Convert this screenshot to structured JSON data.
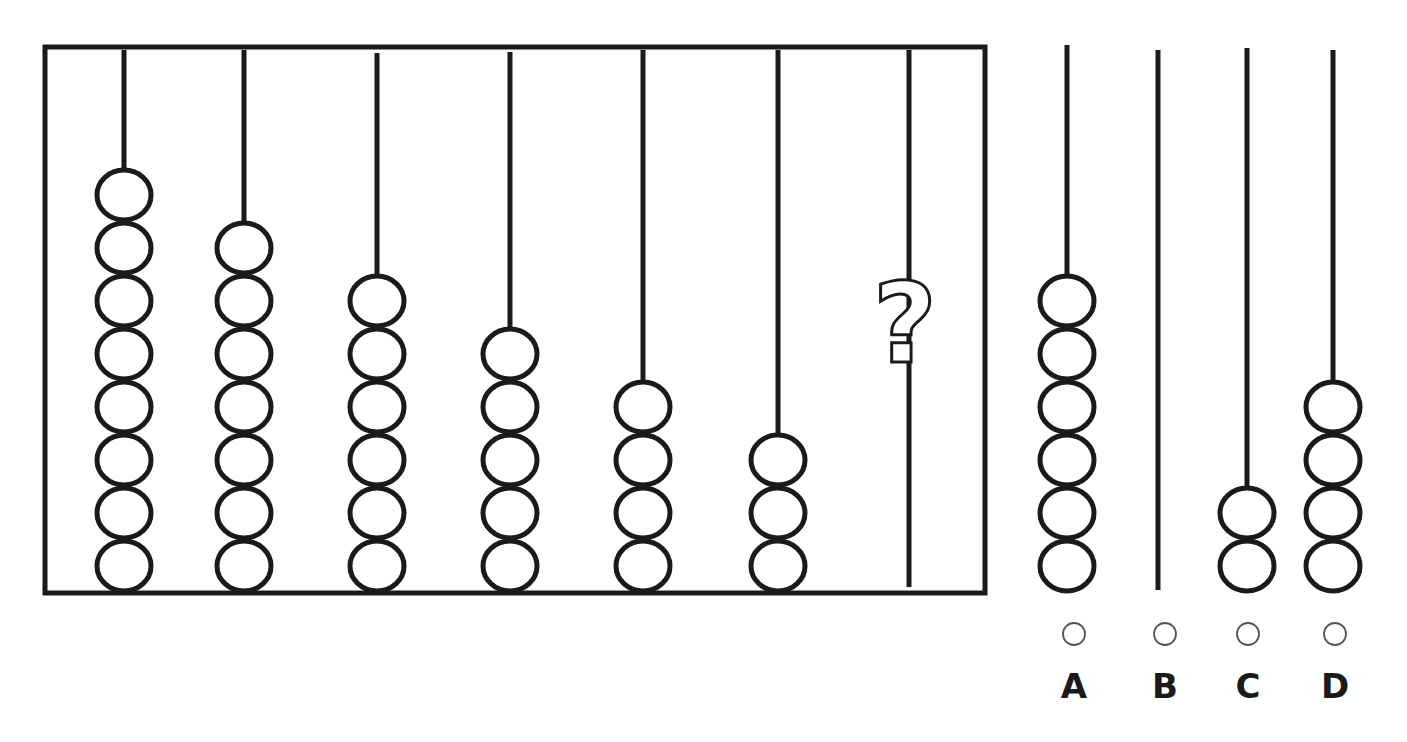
{
  "puzzle": {
    "title": "Abacus sequence puzzle",
    "frame": {
      "x": 45,
      "y": 47,
      "width": 940,
      "height": 546
    },
    "rods": [
      {
        "x": 124,
        "top": 50,
        "beads": 8
      },
      {
        "x": 244,
        "top": 50,
        "beads": 7
      },
      {
        "x": 377,
        "top": 53,
        "beads": 6
      },
      {
        "x": 510,
        "top": 52,
        "beads": 5
      },
      {
        "x": 643,
        "top": 50,
        "beads": 4
      },
      {
        "x": 778,
        "top": 50,
        "beads": 3
      },
      {
        "x": 909,
        "top": 50,
        "beads": null,
        "unknown": true
      }
    ],
    "question_mark": "?",
    "bead_style": {
      "rx": 27,
      "ry": 25,
      "spacing": 53,
      "bottom_center": 566,
      "stroke": "#1a1a1a"
    }
  },
  "options": [
    {
      "label": "A",
      "x": 1067,
      "top": 45,
      "bottom": 588,
      "beads": 6,
      "radio_x": 1074
    },
    {
      "label": "B",
      "x": 1158,
      "top": 50,
      "bottom": 590,
      "beads": 0,
      "radio_x": 1165
    },
    {
      "label": "C",
      "x": 1247,
      "top": 48,
      "bottom": 588,
      "beads": 2,
      "radio_x": 1248
    },
    {
      "label": "D",
      "x": 1333,
      "top": 50,
      "bottom": 588,
      "beads": 4,
      "radio_x": 1335
    }
  ],
  "radio_y": 634,
  "label_y": 686,
  "colors": {
    "ink": "#1a1a1a",
    "radio": "#555555",
    "background": "#ffffff"
  }
}
